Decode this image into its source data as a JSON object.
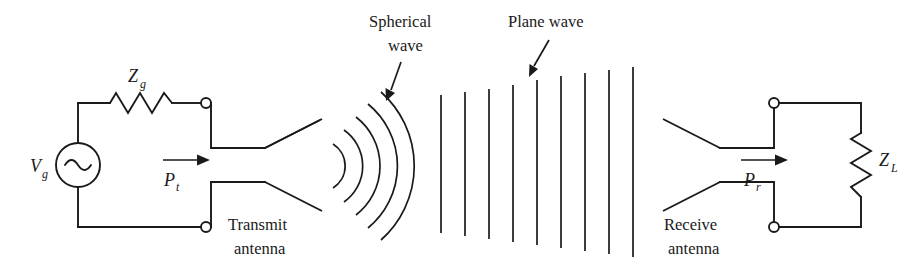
{
  "figure": {
    "background_color": "#ffffff",
    "ink_color": "#1a1a1a",
    "width": 908,
    "height": 268
  },
  "labels": {
    "source_voltage": "V",
    "source_voltage_sub": "g",
    "source_impedance": "Z",
    "source_impedance_sub": "g",
    "transmit_power": "P",
    "transmit_power_sub": "t",
    "received_power": "P",
    "received_power_sub": "r",
    "load_impedance": "Z",
    "load_impedance_sub": "L",
    "transmit_antenna_line1": "Transmit",
    "transmit_antenna_line2": "antenna",
    "receive_antenna_line1": "Receive",
    "receive_antenna_line2": "antenna",
    "spherical_wave_line1": "Spherical",
    "spherical_wave_line2": "wave",
    "plane_wave": "Plane wave"
  },
  "icons": {
    "ac_source": "sine-wave-source-icon",
    "resistor_source": "resistor-zigzag-icon",
    "resistor_load": "resistor-zigzag-icon",
    "terminal": "open-terminal-circle-icon",
    "power_arrow": "right-arrow-icon",
    "leader_arrow": "leader-arrow-icon"
  },
  "wave_data": {
    "spherical_arcs": 5,
    "plane_wave_lines": 9,
    "plane_wave_x_start": 441,
    "plane_wave_spacing": 24,
    "propagation_direction": "left-to-right"
  }
}
